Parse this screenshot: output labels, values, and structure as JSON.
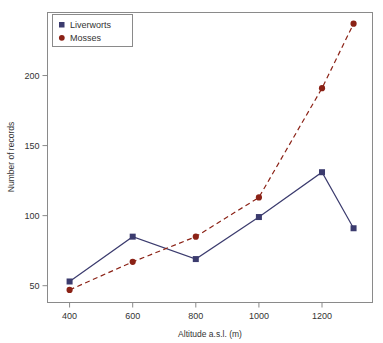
{
  "chart_data": {
    "type": "line",
    "title": "",
    "xlabel": "Altitude a.s.l. (m)",
    "ylabel": "Number of records",
    "x": [
      400,
      600,
      800,
      1000,
      1200,
      1300
    ],
    "xlim": [
      330,
      1360
    ],
    "ylim": [
      38,
      245
    ],
    "xticks": [
      400,
      600,
      800,
      1000,
      1200
    ],
    "yticks": [
      50,
      100,
      150,
      200
    ],
    "xtick_labels": [
      "400",
      "600",
      "800",
      "1000",
      "1200"
    ],
    "ytick_labels": [
      "50",
      "100",
      "150",
      "200"
    ],
    "grid": false,
    "legend_position": "top-left",
    "series": [
      {
        "name": "Liverworts",
        "color": "#3b3b6e",
        "marker": "square",
        "linestyle": "solid",
        "values": [
          53,
          85,
          69,
          99,
          131,
          91
        ]
      },
      {
        "name": "Mosses",
        "color": "#8b2216",
        "marker": "circle",
        "linestyle": "dashed",
        "values": [
          47,
          67,
          85,
          113,
          191,
          237
        ]
      }
    ]
  },
  "legend": {
    "items": [
      {
        "label": "Liverworts",
        "marker": "square-marker",
        "color": "#3b3b6e"
      },
      {
        "label": "Mosses",
        "marker": "circle-marker",
        "color": "#8b2216"
      }
    ]
  },
  "axes": {
    "x_title": "Altitude a.s.l. (m)",
    "y_title": "Number of records"
  }
}
